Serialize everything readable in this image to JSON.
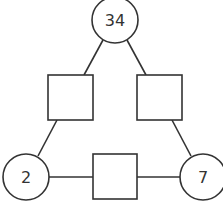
{
  "diagram": {
    "type": "arithmagon-triangle",
    "circles": [
      {
        "id": "top",
        "value": "34",
        "cx": 115,
        "cy": 20
      },
      {
        "id": "bottom-left",
        "value": "2",
        "cx": 26,
        "cy": 177
      },
      {
        "id": "bottom-right",
        "value": "7",
        "cx": 203,
        "cy": 177
      }
    ],
    "squares": [
      {
        "id": "left",
        "value": "",
        "x": 48,
        "y": 75
      },
      {
        "id": "right",
        "value": "",
        "x": 137,
        "y": 75
      },
      {
        "id": "bottom",
        "value": "",
        "x": 93,
        "y": 154
      }
    ],
    "stroke_color": "#333333"
  }
}
